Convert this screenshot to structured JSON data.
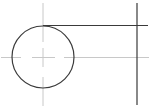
{
  "diagram": {
    "type": "cad-sketch",
    "colors": {
      "background": "#ffffff",
      "object_line": "#3a3a3a",
      "center_line": "#c8c8c8"
    },
    "circle": {
      "cx": 43,
      "cy": 57,
      "r": 31
    },
    "tangent_line": {
      "x1": 43,
      "y1": 25.5,
      "x2": 148,
      "y2": 25.5
    },
    "vertical_line": {
      "x1": 137,
      "y1": 3,
      "x2": 137,
      "y2": 105
    },
    "center_lines": {
      "horizontal": {
        "y": 57.5,
        "segments": [
          [
            1,
            21
          ],
          [
            32,
            55
          ],
          [
            64,
            149
          ]
        ]
      },
      "vertical": {
        "x": 43,
        "segments": [
          [
            3,
            42
          ],
          [
            48,
            67
          ],
          [
            77,
            106
          ]
        ]
      }
    }
  }
}
